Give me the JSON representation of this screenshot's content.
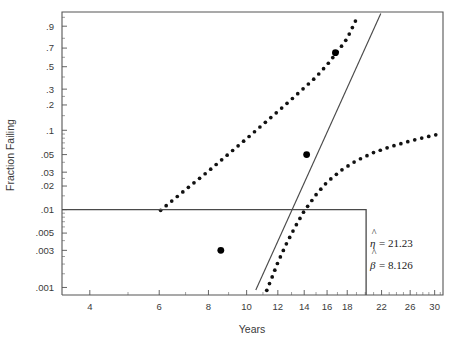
{
  "chart_data": {
    "type": "scatter",
    "title": "",
    "xlabel": "Years",
    "ylabel": "Fraction Failing",
    "x_scale": "log",
    "y_scale": "weibull",
    "xlim": [
      3.4,
      31.5
    ],
    "ylim": [
      0.0008,
      0.97
    ],
    "grid": false,
    "legend": false,
    "x_ticks": [
      {
        "value": 4,
        "label": "4"
      },
      {
        "value": 6,
        "label": "6"
      },
      {
        "value": 8,
        "label": "8"
      },
      {
        "value": 10,
        "label": "10"
      },
      {
        "value": 12,
        "label": "12"
      },
      {
        "value": 14,
        "label": "14"
      },
      {
        "value": 16,
        "label": "16"
      },
      {
        "value": 18,
        "label": "18"
      },
      {
        "value": 22,
        "label": "22"
      },
      {
        "value": 26,
        "label": "26"
      },
      {
        "value": 30,
        "label": "30"
      }
    ],
    "x_minor_ticks": [
      5,
      7,
      9,
      11,
      13,
      15,
      17,
      19,
      20,
      21,
      23,
      24,
      25,
      27,
      28,
      29,
      31
    ],
    "y_ticks": [
      {
        "value": 0.9,
        "label": ".9"
      },
      {
        "value": 0.7,
        "label": ".7"
      },
      {
        "value": 0.5,
        "label": ".5"
      },
      {
        "value": 0.3,
        "label": ".3"
      },
      {
        "value": 0.2,
        "label": ".2"
      },
      {
        "value": 0.1,
        "label": ".1"
      },
      {
        "value": 0.05,
        "label": ".05"
      },
      {
        "value": 0.03,
        "label": ".03"
      },
      {
        "value": 0.02,
        "label": ".02"
      },
      {
        "value": 0.01,
        "label": ".01"
      },
      {
        "value": 0.005,
        "label": ".005"
      },
      {
        "value": 0.003,
        "label": ".003"
      },
      {
        "value": 0.001,
        "label": ".001"
      }
    ],
    "series": [
      {
        "name": "data-points",
        "style": "filled-circle",
        "points": [
          {
            "x": 8.6,
            "y": 0.003
          },
          {
            "x": 14.2,
            "y": 0.05
          },
          {
            "x": 16.8,
            "y": 0.65
          }
        ]
      },
      {
        "name": "weibull-fit-line",
        "style": "solid-line",
        "points": [
          {
            "x": 10.55,
            "y": 0.00093
          },
          {
            "x": 21.9,
            "y": 0.965
          }
        ]
      },
      {
        "name": "upper-confidence-band",
        "style": "dotted-curve",
        "points": [
          {
            "x": 6.05,
            "y": 0.0098
          },
          {
            "x": 7.0,
            "y": 0.018
          },
          {
            "x": 8.0,
            "y": 0.031
          },
          {
            "x": 9.0,
            "y": 0.051
          },
          {
            "x": 10.0,
            "y": 0.079
          },
          {
            "x": 11.0,
            "y": 0.118
          },
          {
            "x": 12.0,
            "y": 0.168
          },
          {
            "x": 13.0,
            "y": 0.232
          },
          {
            "x": 14.0,
            "y": 0.31
          },
          {
            "x": 15.0,
            "y": 0.4
          },
          {
            "x": 16.0,
            "y": 0.52
          },
          {
            "x": 17.0,
            "y": 0.66
          },
          {
            "x": 18.0,
            "y": 0.8
          },
          {
            "x": 18.7,
            "y": 0.91
          },
          {
            "x": 19.2,
            "y": 0.96
          }
        ]
      },
      {
        "name": "lower-confidence-band",
        "style": "dotted-curve",
        "points": [
          {
            "x": 11.25,
            "y": 0.00092
          },
          {
            "x": 11.6,
            "y": 0.00135
          },
          {
            "x": 12.0,
            "y": 0.0021
          },
          {
            "x": 12.6,
            "y": 0.0036
          },
          {
            "x": 13.3,
            "y": 0.0061
          },
          {
            "x": 14.0,
            "y": 0.0096
          },
          {
            "x": 15.0,
            "y": 0.0155
          },
          {
            "x": 16.0,
            "y": 0.0225
          },
          {
            "x": 17.5,
            "y": 0.0325
          },
          {
            "x": 19.0,
            "y": 0.042
          },
          {
            "x": 21.0,
            "y": 0.053
          },
          {
            "x": 23.0,
            "y": 0.062
          },
          {
            "x": 25.5,
            "y": 0.072
          },
          {
            "x": 28.0,
            "y": 0.081
          },
          {
            "x": 30.2,
            "y": 0.088
          }
        ]
      },
      {
        "name": "censoring-step-line",
        "style": "solid-step",
        "points": [
          {
            "x": 3.4,
            "y": 0.01
          },
          {
            "x": 20.1,
            "y": 0.01
          },
          {
            "x": 20.1,
            "y": 0.0008
          }
        ]
      }
    ],
    "annotations": [
      {
        "name": "eta-estimate",
        "symbol": "η",
        "hat": true,
        "text": "= 21.23",
        "value": 21.23,
        "full": "η̂ = 21.23"
      },
      {
        "name": "beta-estimate",
        "symbol": "β",
        "hat": true,
        "text": "= 8.126",
        "value": 8.126,
        "full": "β̂ = 8.126"
      }
    ]
  },
  "colors": {
    "background": "#ffffff",
    "axis": "#555555",
    "line": "#4a4a4a",
    "marker": "#000000",
    "text": "#3a3a3a"
  }
}
